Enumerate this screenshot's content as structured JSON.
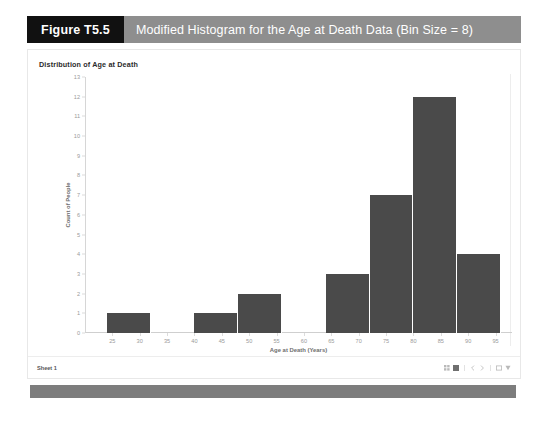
{
  "figure": {
    "tag": "Figure T5.5",
    "caption": "Modified Histogram for the Age at Death Data (Bin Size = 8)"
  },
  "statusbar": {
    "sheet_name": "Sheet 1",
    "tools": [
      "grid-view-icon",
      "fit-view-icon",
      "prev-arrow-icon",
      "next-arrow-icon",
      "fullscreen-icon",
      "share-icon"
    ]
  },
  "colors": {
    "tag_bg": "#111111",
    "caption_bg": "#8e8e8e",
    "bar": "#4a4a4a",
    "footer": "#7d7d7d",
    "axis_text": "#9a9a9a"
  },
  "chart_data": {
    "type": "bar",
    "title": "Distribution of Age at Death",
    "xlabel": "Age at Death (Years)",
    "ylabel": "Count of People",
    "xlim": [
      20,
      98
    ],
    "ylim": [
      0,
      13
    ],
    "grid": false,
    "legend": false,
    "bin_size": 8,
    "xticks": [
      25,
      30,
      35,
      40,
      45,
      50,
      55,
      60,
      65,
      70,
      75,
      80,
      85,
      90,
      95
    ],
    "yticks": [
      0,
      1,
      2,
      3,
      4,
      5,
      6,
      7,
      8,
      9,
      10,
      11,
      12,
      13
    ],
    "bins": [
      {
        "start": 24,
        "end": 32,
        "count": 1
      },
      {
        "start": 40,
        "end": 48,
        "count": 1
      },
      {
        "start": 48,
        "end": 56,
        "count": 2
      },
      {
        "start": 64,
        "end": 72,
        "count": 3
      },
      {
        "start": 72,
        "end": 80,
        "count": 7
      },
      {
        "start": 80,
        "end": 88,
        "count": 12
      },
      {
        "start": 88,
        "end": 96,
        "count": 4
      }
    ],
    "categories": [
      "24-32",
      "40-48",
      "48-56",
      "64-72",
      "72-80",
      "80-88",
      "88-96"
    ],
    "values": [
      1,
      1,
      2,
      3,
      7,
      12,
      4
    ]
  }
}
